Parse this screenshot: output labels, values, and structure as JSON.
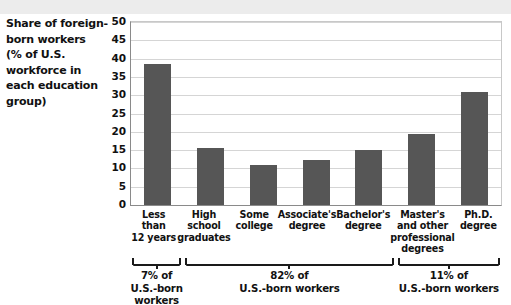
{
  "chart_data": {
    "type": "bar",
    "xlabel": "",
    "ylabel": "",
    "ylim": [
      0,
      50
    ],
    "ytick_step": 5,
    "grid": true,
    "legend": "none",
    "bar_color": "#565656",
    "categories": [
      "Less than 12 years",
      "High school graduates",
      "Some college",
      "Associate's degree",
      "Bachelor's degree",
      "Master's and other professional degrees",
      "Ph.D. degree"
    ],
    "values": [
      38.6,
      15.6,
      11.0,
      12.3,
      15.1,
      19.4,
      30.8
    ],
    "yticks": [
      "50",
      "45",
      "40",
      "35",
      "30",
      "25",
      "20",
      "15",
      "10",
      "5",
      "0"
    ],
    "annotations": [
      {
        "label": "7% of U.S.-born workers",
        "covers": [
          0,
          0
        ]
      },
      {
        "label": "82% of U.S.-born workers",
        "covers": [
          1,
          4
        ]
      },
      {
        "label": "11% of U.S.-born workers",
        "covers": [
          5,
          6
        ]
      }
    ]
  },
  "title": {
    "line1": "Share of foreign-",
    "line2": "born workers",
    "line3": "(% of U.S.",
    "line4": "workforce in",
    "line5": "each education",
    "line6": "group)"
  },
  "x_labels": [
    {
      "l1": "Less than",
      "l2": "12 years",
      "l3": "",
      "l4": ""
    },
    {
      "l1": "High",
      "l2": "school",
      "l3": "graduates",
      "l4": ""
    },
    {
      "l1": "Some",
      "l2": "college",
      "l3": "",
      "l4": ""
    },
    {
      "l1": "Associate's",
      "l2": "degree",
      "l3": "",
      "l4": ""
    },
    {
      "l1": "Bachelor's",
      "l2": "degree",
      "l3": "",
      "l4": ""
    },
    {
      "l1": "Master's",
      "l2": "and other",
      "l3": "professional",
      "l4": "degrees"
    },
    {
      "l1": "Ph.D.",
      "l2": "degree",
      "l3": "",
      "l4": ""
    }
  ],
  "brackets": [
    {
      "pct": "7% of",
      "who": "U.S.-born workers"
    },
    {
      "pct": "82% of",
      "who": "U.S.-born workers"
    },
    {
      "pct": "11% of",
      "who": "U.S.-born workers"
    }
  ]
}
